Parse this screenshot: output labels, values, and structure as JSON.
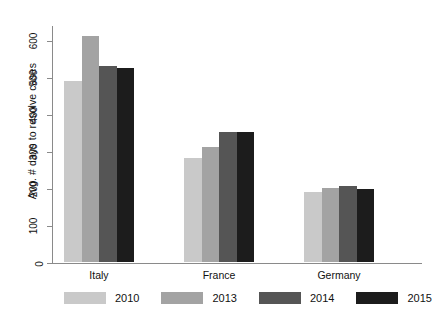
{
  "chart_data": {
    "type": "bar",
    "title": "",
    "subtitle": "",
    "xlabel": "",
    "ylabel": "Avg. # days to resolve cases",
    "categories": [
      "Italy",
      "France",
      "Germany"
    ],
    "series": [
      {
        "name": "2010",
        "color": "#c9c9c9",
        "values": [
          490,
          280,
          190
        ]
      },
      {
        "name": "2013",
        "color": "#a3a3a3",
        "values": [
          610,
          310,
          200
        ]
      },
      {
        "name": "2014",
        "color": "#555555",
        "values": [
          530,
          352,
          205
        ]
      },
      {
        "name": "2015",
        "color": "#1c1c1c",
        "values": [
          525,
          350,
          196
        ]
      }
    ],
    "ylim": [
      0,
      640
    ],
    "yticks": [
      0,
      100,
      200,
      300,
      400,
      500,
      600
    ],
    "ytick_labels": [
      "0",
      "100",
      "200",
      "300",
      "400",
      "500",
      "600"
    ],
    "grid": false,
    "legend_position": "bottom",
    "legend_entries": [
      "2010",
      "2013",
      "2014",
      "2015"
    ]
  }
}
